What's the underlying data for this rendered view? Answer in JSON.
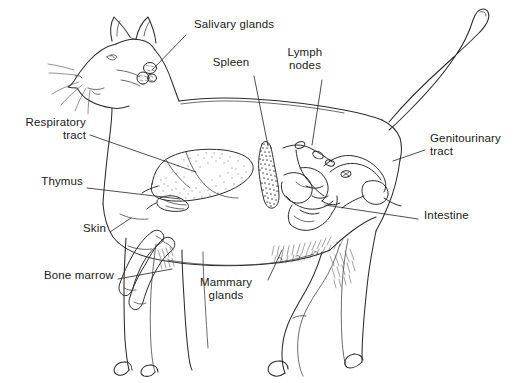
{
  "figure": {
    "kind": "anatomical-diagram",
    "view": "left lateral",
    "background_color": "#ffffff",
    "ink_color": "#2b2b2b",
    "width": 514,
    "height": 383
  },
  "labels": [
    {
      "id": "salivary-glands",
      "text": "Salivary glands",
      "lines": [
        "Salivary glands"
      ],
      "align": "left",
      "text_x": 194,
      "text_y": 24,
      "leader": {
        "x1": 186,
        "y1": 35,
        "x2": 152,
        "y2": 70
      }
    },
    {
      "id": "spleen",
      "text": "Spleen",
      "lines": [
        "Spleen"
      ],
      "align": "center",
      "text_x": 231,
      "text_y": 62,
      "leader": {
        "x1": 254,
        "y1": 76,
        "x2": 268,
        "y2": 146
      }
    },
    {
      "id": "lymph-nodes",
      "text": "Lymph nodes",
      "lines": [
        "Lymph",
        "nodes"
      ],
      "align": "center",
      "text_x": 305,
      "text_y": 52,
      "leader": {
        "x1": 322,
        "y1": 80,
        "x2": 312,
        "y2": 145
      }
    },
    {
      "id": "genitourinary-tract",
      "text": "Genitourinary tract",
      "lines": [
        "Genitourinary",
        "tract"
      ],
      "align": "left",
      "text_x": 430,
      "text_y": 138,
      "leader": {
        "x1": 425,
        "y1": 150,
        "x2": 393,
        "y2": 161
      }
    },
    {
      "id": "intestine",
      "text": "Intestine",
      "lines": [
        "Intestine"
      ],
      "align": "left",
      "text_x": 424,
      "text_y": 215,
      "leader": {
        "x1": 418,
        "y1": 219,
        "x2": 325,
        "y2": 205
      }
    },
    {
      "id": "respiratory-tract",
      "text": "Respiratory tract",
      "lines": [
        "Respiratory",
        "tract"
      ],
      "align": "right",
      "text_x": 16,
      "text_y": 122,
      "leader": {
        "x1": 90,
        "y1": 135,
        "x2": 196,
        "y2": 172
      }
    },
    {
      "id": "thymus",
      "text": "Thymus",
      "lines": [
        "Thymus"
      ],
      "align": "right",
      "text_x": 38,
      "text_y": 181,
      "leader": {
        "x1": 87,
        "y1": 188,
        "x2": 180,
        "y2": 199
      }
    },
    {
      "id": "skin",
      "text": "Skin",
      "lines": [
        "Skin"
      ],
      "align": "right",
      "text_x": 78,
      "text_y": 228,
      "leader": {
        "x1": 110,
        "y1": 232,
        "x2": 131,
        "y2": 218
      }
    },
    {
      "id": "bone-marrow",
      "text": "Bone marrow",
      "lines": [
        "Bone marrow"
      ],
      "align": "right",
      "text_x": 36,
      "text_y": 275,
      "leader": {
        "x1": 118,
        "y1": 279,
        "x2": 172,
        "y2": 269
      }
    },
    {
      "id": "mammary-glands",
      "text": "Mammary glands",
      "lines": [
        "Mammary",
        "glands"
      ],
      "align": "center",
      "text_x": 226,
      "text_y": 282,
      "leader": {
        "x1": 268,
        "y1": 280,
        "x2": 282,
        "y2": 250
      }
    }
  ],
  "organs": [
    {
      "id": "salivary-glands-organ",
      "name": "salivary glands",
      "shading": "outline-cluster"
    },
    {
      "id": "lung-organ",
      "name": "lungs / respiratory tract",
      "shading": "stipple-light"
    },
    {
      "id": "thymus-organ",
      "name": "thymus",
      "shading": "outline"
    },
    {
      "id": "spleen-organ",
      "name": "spleen",
      "shading": "stipple-dark"
    },
    {
      "id": "lymph-node-organ",
      "name": "lymph nodes",
      "shading": "outline"
    },
    {
      "id": "intestine-organ",
      "name": "intestine",
      "shading": "outline-coils"
    },
    {
      "id": "genitourinary-organ",
      "name": "genitourinary tract",
      "shading": "outline"
    },
    {
      "id": "bone-marrow-organ",
      "name": "bone marrow / long bones",
      "shading": "outline"
    },
    {
      "id": "mammary-glands-organ",
      "name": "mammary glands",
      "shading": "hatch"
    }
  ]
}
